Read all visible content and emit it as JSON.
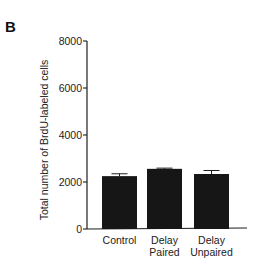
{
  "panel_label": "B",
  "chart_data": {
    "type": "bar",
    "title": "",
    "xlabel": "",
    "ylabel": "Total number of BrdU-labeled cells",
    "ylim": [
      0,
      8000
    ],
    "yticks": [
      0,
      2000,
      4000,
      6000,
      8000
    ],
    "ytick_labels": [
      "0",
      "2000",
      "4000",
      "6000",
      "8000"
    ],
    "grid": false,
    "legend": null,
    "categories": [
      "Control",
      "Delay Paired",
      "Delay Unpaired"
    ],
    "category_label_lines": [
      [
        "Control"
      ],
      [
        "Delay",
        "Paired"
      ],
      [
        "Delay",
        "Unpaired"
      ]
    ],
    "values": [
      2250,
      2560,
      2340
    ],
    "errors": [
      100,
      30,
      150
    ],
    "bar_color": "#161616"
  }
}
